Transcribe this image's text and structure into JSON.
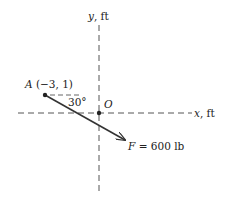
{
  "diagram": {
    "axes": {
      "y_label_var": "y",
      "y_label_unit": ", ft",
      "x_label_var": "x",
      "x_label_unit": ", ft"
    },
    "origin": {
      "label": "O"
    },
    "point_a": {
      "name": "A",
      "coords": "(−3, 1)"
    },
    "angle": {
      "label": "30°"
    },
    "force": {
      "var": "F",
      "value": " = 600 lb"
    },
    "colors": {
      "line": "#333333",
      "dash": "#555555",
      "text": "#222222"
    }
  }
}
